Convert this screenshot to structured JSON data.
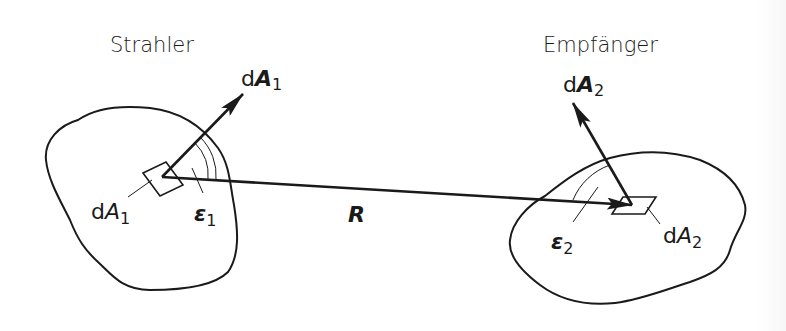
{
  "diagram": {
    "type": "radiation-exchange-geometry",
    "emitter": {
      "label": "Strahler",
      "area_element": {
        "prefix": "d",
        "symbol": "A",
        "subscript": "1"
      },
      "normal_vector": {
        "prefix": "d",
        "symbol": "A",
        "subscript": "1"
      },
      "angle": {
        "symbol": "ε",
        "subscript": "1"
      }
    },
    "receiver": {
      "label": "Empfänger",
      "area_element": {
        "prefix": "d",
        "symbol": "A",
        "subscript": "2"
      },
      "normal_vector": {
        "prefix": "d",
        "symbol": "A",
        "subscript": "2"
      },
      "angle": {
        "symbol": "ε",
        "subscript": "2"
      }
    },
    "connection": {
      "symbol": "R"
    },
    "colors": {
      "stroke": "#1a1a1a",
      "background": "#ffffff"
    }
  }
}
